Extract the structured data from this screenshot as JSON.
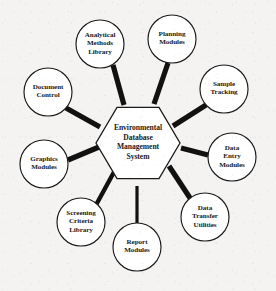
{
  "diagram": {
    "background_color": "#f4f3f1",
    "stroke_color": "#1a1a1a",
    "node_fill_color": "#ffffff",
    "spoke_color": "#111111"
  },
  "hub": {
    "shape": "hexagon",
    "label": "Environmental\nDatabase\nManagement\nSystem",
    "lines": [
      "Environmental",
      "Database",
      "Management",
      "System"
    ],
    "center_x": 138,
    "center_y": 143,
    "radius": 42
  },
  "satellites": [
    {
      "id": "analytical-methods-library",
      "label": "Analytical\nMethods\nLibrary",
      "lines": [
        "Analytical",
        "Methods",
        "Library"
      ],
      "cx": 100,
      "cy": 44,
      "r": 24
    },
    {
      "id": "planning-modules",
      "label": "Planning\nModules",
      "lines": [
        "Planning",
        "Modules"
      ],
      "cx": 172,
      "cy": 39,
      "r": 24
    },
    {
      "id": "sample-tracking",
      "label": "Sample\nTracking",
      "lines": [
        "Sample",
        "Tracking"
      ],
      "cx": 224,
      "cy": 89,
      "r": 24
    },
    {
      "id": "data-entry-modules",
      "label": "Data\nEntry\nModules",
      "lines": [
        "Data",
        "Entry",
        "Modules"
      ],
      "cx": 232,
      "cy": 157,
      "r": 24
    },
    {
      "id": "data-transfer-utilities",
      "label": "Data\nTransfer\nUtilities",
      "lines": [
        "Data",
        "Transfer",
        "Utilities"
      ],
      "cx": 205,
      "cy": 217,
      "r": 24
    },
    {
      "id": "report-modules",
      "label": "Report\nModules",
      "lines": [
        "Report",
        "Modules"
      ],
      "cx": 137,
      "cy": 247,
      "r": 24
    },
    {
      "id": "screening-criteria-library",
      "label": "Screening\nCriteria\nLibrary",
      "lines": [
        "Screening",
        "Criteria",
        "Library"
      ],
      "cx": 81,
      "cy": 222,
      "r": 24
    },
    {
      "id": "graphics-modules",
      "label": "Graphics\nModules",
      "lines": [
        "Graphics",
        "Modules"
      ],
      "cx": 44,
      "cy": 164,
      "r": 24
    },
    {
      "id": "document-control",
      "label": "Document\nControl",
      "lines": [
        "Document",
        "Control"
      ],
      "cx": 48,
      "cy": 92,
      "r": 24
    }
  ],
  "spokes": [
    {
      "id": "spoke-analytical-methods-library",
      "x1": 113,
      "y1": 65,
      "x2": 124,
      "y2": 105,
      "width": 5.2
    },
    {
      "id": "spoke-planning-modules",
      "x1": 168,
      "y1": 63,
      "x2": 154,
      "y2": 104,
      "width": 5.2
    },
    {
      "id": "spoke-sample-tracking",
      "x1": 206,
      "y1": 105,
      "x2": 173,
      "y2": 126,
      "width": 5.2
    },
    {
      "id": "spoke-data-entry-modules",
      "x1": 208,
      "y1": 155,
      "x2": 181,
      "y2": 148,
      "width": 5.2
    },
    {
      "id": "spoke-data-transfer-utilities",
      "x1": 190,
      "y1": 198,
      "x2": 169,
      "y2": 166,
      "width": 5.2
    },
    {
      "id": "spoke-report-modules",
      "x1": 137,
      "y1": 223,
      "x2": 137,
      "y2": 186,
      "width": 3.2
    },
    {
      "id": "spoke-screening-criteria-library",
      "x1": 96,
      "y1": 205,
      "x2": 114,
      "y2": 172,
      "width": 4.4
    },
    {
      "id": "spoke-graphics-modules",
      "x1": 68,
      "y1": 160,
      "x2": 99,
      "y2": 147,
      "width": 5.2
    },
    {
      "id": "spoke-document-control",
      "x1": 66,
      "y1": 108,
      "x2": 100,
      "y2": 127,
      "width": 5.2
    }
  ]
}
